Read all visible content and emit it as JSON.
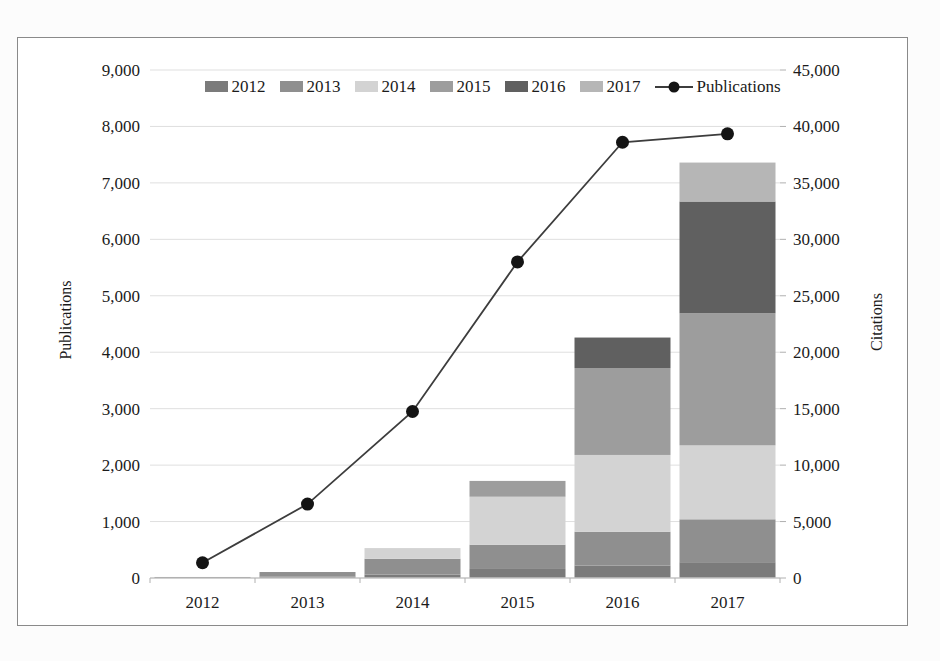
{
  "page": {
    "background": "#fcfcfc"
  },
  "figure": {
    "background": "#ffffff",
    "border_color": "#8a8a8a"
  },
  "chart_data": {
    "type": "bar",
    "subtype": "stacked-bars-with-line-overlay",
    "title": "",
    "categories": [
      "2012",
      "2013",
      "2014",
      "2015",
      "2016",
      "2017"
    ],
    "stacked_series": [
      {
        "name": "2012",
        "color": "#7b7b7b",
        "values": [
          90,
          130,
          300,
          800,
          1100,
          1400
        ]
      },
      {
        "name": "2013",
        "color": "#8f8f8f",
        "values": [
          0,
          400,
          1400,
          2150,
          3000,
          3800
        ]
      },
      {
        "name": "2014",
        "color": "#d3d3d3",
        "values": [
          0,
          0,
          950,
          4250,
          6800,
          6550
        ]
      },
      {
        "name": "2015",
        "color": "#9d9d9d",
        "values": [
          0,
          0,
          0,
          1400,
          7700,
          11700
        ]
      },
      {
        "name": "2016",
        "color": "#606060",
        "values": [
          0,
          0,
          0,
          0,
          2700,
          9900
        ]
      },
      {
        "name": "2017",
        "color": "#b6b6b6",
        "values": [
          0,
          0,
          0,
          0,
          0,
          3450
        ]
      }
    ],
    "bar_totals_citations": [
      90,
      530,
      2650,
      8600,
      21300,
      36800
    ],
    "line_series": {
      "name": "Publications",
      "axis": "left",
      "color": "#3d3d3d",
      "marker_color": "#141414",
      "values": [
        270,
        1310,
        2950,
        5600,
        7720,
        7870
      ]
    },
    "left_axis": {
      "title": "Publications",
      "min": 0,
      "max": 9000,
      "step": 1000,
      "tick_labels": [
        "0",
        "1,000",
        "2,000",
        "3,000",
        "4,000",
        "5,000",
        "6,000",
        "7,000",
        "8,000",
        "9,000"
      ]
    },
    "right_axis": {
      "title": "Citations",
      "min": 0,
      "max": 45000,
      "step": 5000,
      "tick_labels": [
        "0",
        "5,000",
        "10,000",
        "15,000",
        "20,000",
        "25,000",
        "30,000",
        "35,000",
        "40,000",
        "45,000"
      ]
    },
    "x_axis": {
      "tick_labels": [
        "2012",
        "2013",
        "2014",
        "2015",
        "2016",
        "2017"
      ]
    },
    "legend": {
      "items": [
        {
          "label": "2012",
          "type": "swatch",
          "color": "#7b7b7b"
        },
        {
          "label": "2013",
          "type": "swatch",
          "color": "#8f8f8f"
        },
        {
          "label": "2014",
          "type": "swatch",
          "color": "#d3d3d3"
        },
        {
          "label": "2015",
          "type": "swatch",
          "color": "#9d9d9d"
        },
        {
          "label": "2016",
          "type": "swatch",
          "color": "#606060"
        },
        {
          "label": "2017",
          "type": "swatch",
          "color": "#b6b6b6"
        },
        {
          "label": "Publications",
          "type": "line-marker",
          "color": "#3d3d3d",
          "marker_color": "#141414"
        }
      ]
    },
    "grid": {
      "show": true,
      "color": "#dfdfdf"
    },
    "axis_line_color": "#c3c3c3",
    "tick_color": "#b0b0b0",
    "text_color": "#1b1b1b"
  }
}
